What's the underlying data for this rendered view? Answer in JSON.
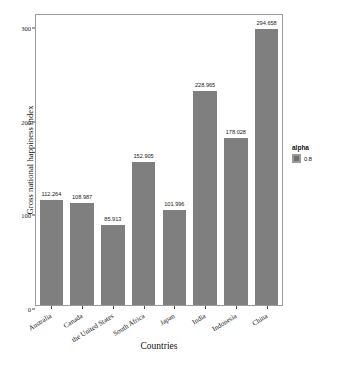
{
  "chart_data": {
    "type": "bar",
    "title": "",
    "xlabel": "Countries",
    "ylabel": "Gross national happiness index",
    "categories": [
      "Australia",
      "Canada",
      "the United States",
      "South Africa",
      "Japan",
      "India",
      "Indonesia",
      "China"
    ],
    "values": [
      112.264,
      108.987,
      85.913,
      152.905,
      101.996,
      228.965,
      178.028,
      294.658
    ],
    "value_labels": [
      "112.264",
      "108.987",
      "85.913",
      "152.905",
      "101.996",
      "228.965",
      "178.028",
      "294.658"
    ],
    "ylim": [
      0,
      310
    ],
    "yticks": [
      0,
      100,
      200,
      300
    ],
    "ytick_labels": [
      "0",
      "100",
      "200",
      "300"
    ],
    "grid": false,
    "bar_color": "#7f7f7f",
    "legend": {
      "position": "right",
      "title": "alpha",
      "entries": [
        {
          "label": "0.8",
          "color": "#6e6e6e"
        }
      ]
    }
  },
  "figure": {
    "panel_border_color": "#9a9a9a",
    "background": "#ffffff",
    "caption": ""
  }
}
